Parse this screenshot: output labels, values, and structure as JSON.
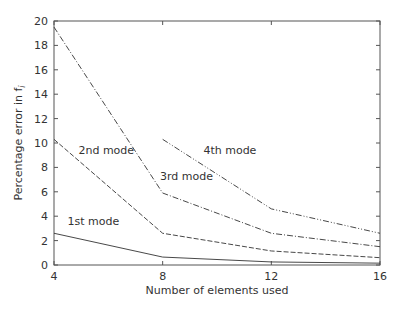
{
  "chart_data": {
    "type": "line",
    "title": "",
    "xlabel": "Number of elements used",
    "ylabel": "Percentage error in f",
    "ylabel_subscript": "i",
    "x": [
      4,
      8,
      12,
      16
    ],
    "xlim": [
      4,
      16
    ],
    "ylim": [
      0,
      20
    ],
    "xticks": [
      4,
      8,
      12,
      16
    ],
    "yticks": [
      0,
      2,
      4,
      6,
      8,
      10,
      12,
      14,
      16,
      18,
      20
    ],
    "grid": false,
    "series": [
      {
        "name": "1st mode",
        "style": "solid",
        "x": [
          4,
          8,
          12,
          16
        ],
        "values": [
          2.6,
          0.65,
          0.25,
          0.15
        ]
      },
      {
        "name": "2nd mode",
        "style": "dashed",
        "x": [
          4,
          8,
          12,
          16
        ],
        "values": [
          10.3,
          2.6,
          1.15,
          0.6
        ]
      },
      {
        "name": "3rd mode",
        "style": "dashdot",
        "x": [
          4,
          8,
          12,
          16
        ],
        "values": [
          19.5,
          5.9,
          2.6,
          1.5
        ]
      },
      {
        "name": "4th mode",
        "style": "dashdotdot",
        "x": [
          8,
          12,
          16
        ],
        "values": [
          10.3,
          4.6,
          2.6
        ]
      }
    ],
    "annotations": [
      {
        "text": "1st mode",
        "x": 4.5,
        "y": 3.3
      },
      {
        "text": "2nd mode",
        "x": 4.9,
        "y": 9.1
      },
      {
        "text": "3rd mode",
        "x": 7.9,
        "y": 7.0
      },
      {
        "text": "4th mode",
        "x": 9.5,
        "y": 9.1
      }
    ]
  }
}
